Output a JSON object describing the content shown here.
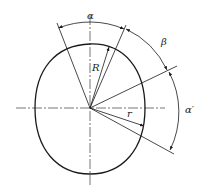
{
  "diagram": {
    "type": "cam-profile-geometry",
    "labels": {
      "alpha": "α",
      "beta": "β",
      "alpha_prime": "α′",
      "big_radius": "R",
      "small_radius": "r"
    },
    "colors": {
      "line": "#1a1a1a",
      "background": "#ffffff"
    }
  }
}
